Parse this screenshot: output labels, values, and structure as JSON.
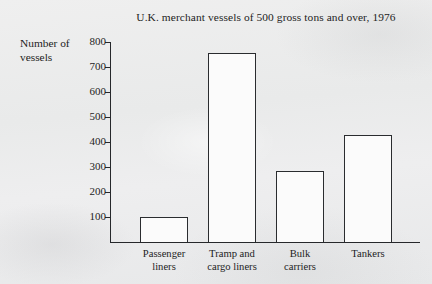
{
  "chart_data": {
    "type": "bar",
    "title": "U.K. merchant vessels of 500 gross tons and over, 1976",
    "xlabel": "",
    "ylabel": "Number of vessels",
    "categories": [
      "Passenger liners",
      "Tramp and cargo liners",
      "Bulk carriers",
      "Tankers"
    ],
    "values": [
      100,
      755,
      285,
      430
    ],
    "ylim": [
      0,
      800
    ],
    "yticks": [
      100,
      200,
      300,
      400,
      500,
      600,
      700,
      800
    ],
    "ytick_labels": [
      "100",
      "200",
      "300",
      "400",
      "500",
      "600",
      "700",
      "800"
    ],
    "grid": false,
    "legend": null,
    "bar_fill_color": "#fbfbfb",
    "bar_edge_color": "#2a2c2f",
    "background_color": "#eceded"
  },
  "axis": {
    "y_label_line1": "Number of",
    "y_label_line2": "vessels"
  },
  "bar_labels": [
    {
      "line1": "Passenger",
      "line2": "liners"
    },
    {
      "line1": "Tramp and",
      "line2": "cargo liners"
    },
    {
      "line1": "Bulk",
      "line2": "carriers"
    },
    {
      "line1": "Tankers",
      "line2": ""
    }
  ]
}
